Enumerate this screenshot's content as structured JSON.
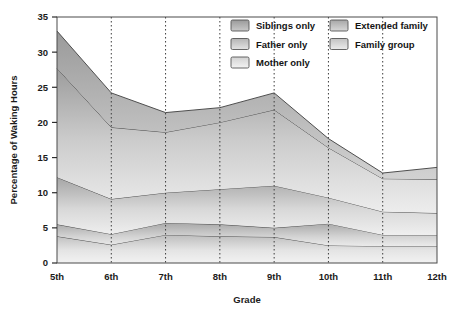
{
  "chart_data": {
    "type": "area",
    "title": "",
    "xlabel": "Grade",
    "ylabel": "Percentage of Waking Hours",
    "categories": [
      "5th",
      "6th",
      "7th",
      "8th",
      "9th",
      "10th",
      "11th",
      "12th"
    ],
    "ylim": [
      0,
      35
    ],
    "yticks": [
      0,
      5,
      10,
      15,
      20,
      25,
      30,
      35
    ],
    "grid": "vertical-dotted",
    "stacked": true,
    "legend_position": "top-right-inside",
    "series": [
      {
        "name": "Mother only",
        "color": "#e8e8e8",
        "values": [
          3.8,
          2.6,
          4.0,
          3.8,
          3.7,
          2.5,
          2.4,
          2.4
        ]
      },
      {
        "name": "Father only",
        "color": "#d0d0d0",
        "values": [
          1.7,
          1.5,
          1.7,
          1.7,
          1.3,
          3.1,
          1.6,
          1.6
        ]
      },
      {
        "name": "Family group",
        "color": "#dcdcdc",
        "values": [
          6.7,
          5.0,
          4.3,
          5.0,
          6.0,
          3.7,
          3.3,
          3.1
        ]
      },
      {
        "name": "Extended family",
        "color": "#c6c6c6",
        "values": [
          15.5,
          10.2,
          8.6,
          9.5,
          10.8,
          7.1,
          4.7,
          4.8
        ]
      },
      {
        "name": "Siblings only",
        "color": "#acacac",
        "values": [
          5.3,
          4.9,
          2.8,
          2.1,
          2.4,
          1.3,
          0.8,
          1.7
        ]
      }
    ],
    "cumulative_tops": {
      "mother_only": [
        3.8,
        2.6,
        4.0,
        3.8,
        3.7,
        2.5,
        2.4,
        2.4
      ],
      "father_only": [
        5.5,
        4.1,
        5.7,
        5.5,
        5.0,
        5.6,
        4.0,
        4.0
      ],
      "family_group": [
        12.2,
        9.1,
        10.0,
        10.5,
        11.0,
        9.3,
        7.3,
        7.1
      ],
      "extended_family": [
        27.7,
        19.3,
        18.6,
        20.0,
        21.8,
        16.4,
        12.0,
        11.9
      ],
      "siblings_only": [
        33.0,
        24.2,
        21.4,
        22.1,
        24.2,
        17.7,
        12.8,
        13.6
      ]
    }
  },
  "legend": {
    "column_left": [
      {
        "label": "Siblings only",
        "color": "#a9a9a9"
      },
      {
        "label": "Father only",
        "color": "#cecece"
      },
      {
        "label": "Mother only",
        "color": "#e6e6e6"
      }
    ],
    "column_right": [
      {
        "label": "Extended family",
        "color": "#c2c2c2"
      },
      {
        "label": "Family group",
        "color": "#dadada"
      }
    ]
  },
  "axes": {
    "y_title": "Percentage of Waking Hours",
    "x_title": "Grade",
    "y_tick_labels": [
      "0",
      "5",
      "10",
      "15",
      "20",
      "25",
      "30",
      "35"
    ],
    "x_tick_labels": [
      "5th",
      "6th",
      "7th",
      "8th",
      "9th",
      "10th",
      "11th",
      "12th"
    ]
  }
}
